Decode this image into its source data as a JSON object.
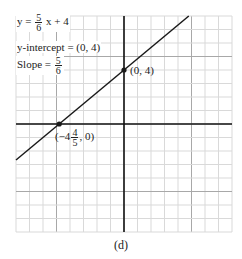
{
  "chart_data": {
    "type": "line",
    "title": "",
    "xlabel": "",
    "ylabel": "",
    "xlim": [
      -8,
      8
    ],
    "ylim": [
      -8,
      8
    ],
    "grid": true,
    "grid_step": 1,
    "major_grid_step": 5,
    "series": [
      {
        "name": "y = 5/6 x + 4",
        "slope": 0.8333,
        "intercept": 4,
        "x": [
          -8,
          4.8
        ],
        "y": [
          -2.667,
          8
        ]
      }
    ],
    "points": [
      {
        "x": 0,
        "y": 4,
        "label": "(0, 4)"
      },
      {
        "x": -4.8,
        "y": 0,
        "label": "(-4 4/5, 0)"
      }
    ],
    "annotations": [
      "y = 5/6 x + 4",
      "y-intercept = (0, 4)",
      "Slope = 5/6"
    ],
    "caption": "(d)"
  },
  "labels": {
    "equation_prefix": "y =",
    "equation_num": "5",
    "equation_den": "6",
    "equation_suffix": "x + 4",
    "intercept_text": "y-intercept = (0, 4)",
    "slope_prefix": "Slope =",
    "slope_num": "5",
    "slope_den": "6",
    "point_y_label": "(0, 4)",
    "point_x_prefix": "(−4",
    "point_x_num": "4",
    "point_x_den": "5",
    "point_x_suffix": ", 0)",
    "caption": "(d)"
  },
  "colors": {
    "grid_minor": "#d9d9d9",
    "grid_major": "#a8a8a8",
    "axes": "#111111",
    "line": "#1a1a1a"
  }
}
